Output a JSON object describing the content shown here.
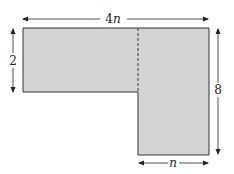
{
  "diagram": {
    "shape_fill": "#d4d4d4",
    "stroke": "#333333",
    "labels": {
      "top_width": "4n",
      "top_coef": "4",
      "top_var": "n",
      "left_height": "2",
      "right_height": "8",
      "bottom_width": "n"
    }
  }
}
